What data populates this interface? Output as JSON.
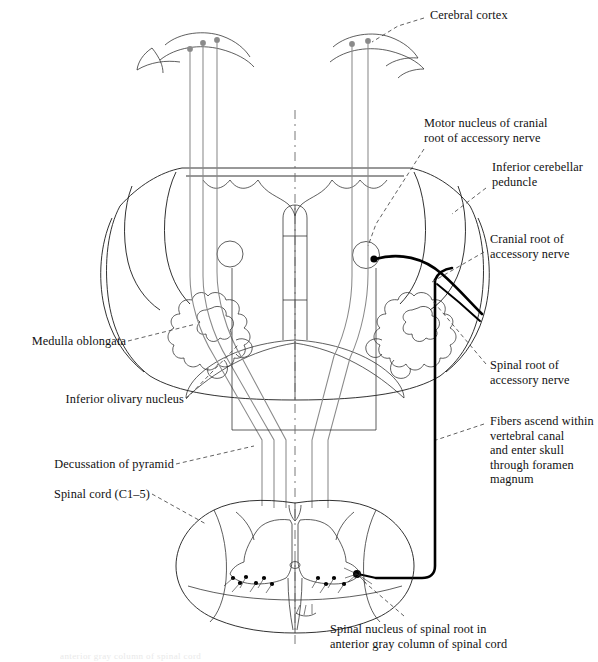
{
  "figure": {
    "type": "anatomical-line-diagram",
    "regions": [
      "cerebral cortex",
      "medulla oblongata",
      "spinal cord (C1-5)"
    ],
    "colors": {
      "ink": "#1b1b1b",
      "gray_fiber": "#8a8a8a",
      "accessory_nerve": "#000000",
      "leader_line": "#3a3a3a",
      "background": "#ffffff"
    }
  },
  "labels": {
    "cerebral_cortex": "Cerebral cortex",
    "motor_nucleus": "Motor nucleus of cranial\nroot of accessory nerve",
    "inferior_cerebellar_peduncle": "Inferior cerebellar\npeduncle",
    "cranial_root": "Cranial root of\naccessory nerve",
    "spinal_root": "Spinal root of\naccessory nerve",
    "fibers_ascend": "Fibers ascend within\nvertebral canal\nand enter skull\nthrough foramen\nmagnum",
    "medulla_oblongata": "Medulla oblongata",
    "inferior_olivary_nucleus": "Inferior olivary nucleus",
    "decussation_of_pyramid": "Decussation of pyramid",
    "spinal_cord": "Spinal cord (C1–5)",
    "spinal_nucleus": "Spinal nucleus of spinal root in\nanterior gray column of spinal cord"
  },
  "caption_cut_off": "anterior gray column of spinal cord"
}
